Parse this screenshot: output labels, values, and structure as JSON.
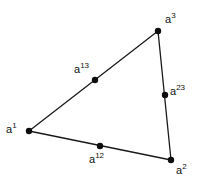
{
  "figure": {
    "background_color": "#ffffff",
    "line_color": "#1a1a1a",
    "node_color": "#0d0d0d",
    "label_color": "#111111",
    "width": 205,
    "height": 188
  },
  "chart_data": {
    "type": "diagram",
    "xlabel": "",
    "ylabel": "",
    "grid": false,
    "legend": "none",
    "xlim": [
      0,
      205
    ],
    "ylim": [
      0,
      188
    ],
    "nodes": [
      {
        "id": "a1",
        "base": "a",
        "superscript": "1",
        "label": "a1",
        "kind": "vertex",
        "x": 29,
        "y": 131,
        "label_x": 6,
        "label_y": 122,
        "label_anchor": "left"
      },
      {
        "id": "a2",
        "base": "a",
        "superscript": "2",
        "label": "a2",
        "kind": "vertex",
        "x": 171,
        "y": 160,
        "label_x": 176,
        "label_y": 163,
        "label_anchor": "left"
      },
      {
        "id": "a3",
        "base": "a",
        "superscript": "3",
        "label": "a3",
        "kind": "vertex",
        "x": 158,
        "y": 31,
        "label_x": 165,
        "label_y": 12,
        "label_anchor": "left"
      },
      {
        "id": "a12",
        "base": "a",
        "superscript": "12",
        "label": "a12",
        "kind": "midpoint",
        "x": 100,
        "y": 146,
        "label_x": 89,
        "label_y": 152,
        "label_anchor": "left"
      },
      {
        "id": "a13",
        "base": "a",
        "superscript": "13",
        "label": "a13",
        "kind": "midpoint",
        "x": 95,
        "y": 80,
        "label_x": 74,
        "label_y": 62,
        "label_anchor": "left"
      },
      {
        "id": "a23",
        "base": "a",
        "superscript": "23",
        "label": "a23",
        "kind": "midpoint",
        "x": 165,
        "y": 95,
        "label_x": 170,
        "label_y": 84,
        "label_anchor": "left"
      }
    ],
    "edges": [
      {
        "id": "edge-a1-a3",
        "from": "a1",
        "to": "a3",
        "via": "a13",
        "x1": 29,
        "y1": 131,
        "x2": 158,
        "y2": 31
      },
      {
        "id": "edge-a1-a2",
        "from": "a1",
        "to": "a2",
        "via": "a12",
        "x1": 29,
        "y1": 131,
        "x2": 171,
        "y2": 160
      },
      {
        "id": "edge-a3-a2",
        "from": "a3",
        "to": "a2",
        "via": "a23",
        "x1": 158,
        "y1": 31,
        "x2": 171,
        "y2": 160
      }
    ],
    "node_radius": 3.2
  }
}
